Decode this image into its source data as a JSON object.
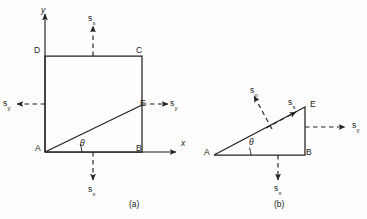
{
  "figure": {
    "kind": "stress-element-diagram",
    "stroke_color": "#222222",
    "background_color": "#fdfdfd",
    "captions": [
      {
        "id": "a",
        "text": "(a)",
        "x": 129,
        "y": 199
      },
      {
        "id": "b",
        "text": "(b)",
        "x": 274,
        "y": 199
      }
    ],
    "panel_a": {
      "axis_labels": [
        {
          "name": "x-axis-label",
          "text": "x",
          "x": 181,
          "y": 139
        },
        {
          "name": "y-axis-label",
          "text": "y",
          "x": 41,
          "y": 6
        }
      ],
      "vertices": [
        {
          "name": "vertex-A",
          "text": "A",
          "x": 35,
          "y": 144
        },
        {
          "name": "vertex-B",
          "text": "B",
          "x": 136,
          "y": 144
        },
        {
          "name": "vertex-C",
          "text": "C",
          "x": 136,
          "y": 46
        },
        {
          "name": "vertex-D",
          "text": "D",
          "x": 34,
          "y": 46
        },
        {
          "name": "vertex-E",
          "text": "E",
          "x": 140,
          "y": 99
        }
      ],
      "angle_label": {
        "name": "theta-label",
        "text": "θ",
        "x": 80,
        "y": 139
      },
      "stress_labels": [
        {
          "name": "stress-sx-top",
          "base": "s",
          "sub": "x",
          "x": 88,
          "y": 14
        },
        {
          "name": "stress-sx-bottom",
          "base": "s",
          "sub": "x",
          "x": 88,
          "y": 185
        },
        {
          "name": "stress-sy-left",
          "base": "s",
          "sub": "y",
          "x": 3,
          "y": 99
        },
        {
          "name": "stress-sy-right",
          "base": "s",
          "sub": "y",
          "x": 170,
          "y": 99
        }
      ]
    },
    "panel_b": {
      "vertices": [
        {
          "name": "vertex-A",
          "text": "A",
          "x": 204,
          "y": 148
        },
        {
          "name": "vertex-B",
          "text": "B",
          "x": 306,
          "y": 148
        },
        {
          "name": "vertex-E",
          "text": "E",
          "x": 310,
          "y": 100
        }
      ],
      "angle_label": {
        "name": "theta-label",
        "text": "θ",
        "x": 249,
        "y": 138
      },
      "stress_labels": [
        {
          "name": "stress-sn-normal",
          "base": "s",
          "sub": "n",
          "x": 250,
          "y": 86
        },
        {
          "name": "stress-ss-shear",
          "base": "s",
          "sub": "s",
          "x": 288,
          "y": 98
        },
        {
          "name": "stress-sy-right",
          "base": "s",
          "sub": "y",
          "x": 352,
          "y": 121
        },
        {
          "name": "stress-sx-bottom",
          "base": "s",
          "sub": "x",
          "x": 274,
          "y": 184
        }
      ]
    }
  }
}
